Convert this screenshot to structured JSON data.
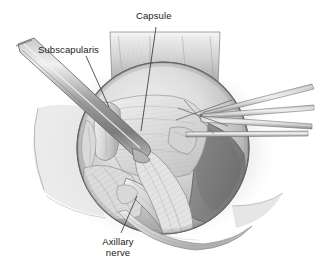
{
  "figure": {
    "kind": "surgical-illustration",
    "style": "grayscale-pencil-rendering",
    "background_color": "#ffffff",
    "width": 321,
    "height": 276
  },
  "labels": {
    "capsule": {
      "text": "Capsule",
      "color": "#1a1a1a",
      "leader": {
        "x1": 156,
        "y1": 27,
        "x2": 141,
        "y2": 131
      }
    },
    "subscapularis": {
      "text": "Subscapularis",
      "color": "#1a1a1a",
      "leader": {
        "x1": 86,
        "y1": 56,
        "x2": 109,
        "y2": 107
      }
    },
    "axillary_nerve": {
      "line1": "Axillary",
      "line2": "nerve",
      "color": "#1a1a1a",
      "leader": {
        "x1": 121,
        "y1": 233,
        "x2": 137,
        "y2": 196
      }
    }
  },
  "palette": {
    "background": "#ffffff",
    "outline": "#4a4a4a",
    "tissue_light": "#e7e7e7",
    "tissue_mid": "#c9c9c9",
    "tissue_dark": "#9a9a9a",
    "cavity_dark": "#8b8b8b",
    "cavity_deep": "#777777",
    "instrument_light": "#d8d8d8",
    "instrument_mid": "#a8a8a8",
    "instrument_dark": "#6e6e6e",
    "leader_line": "#3a3a3a",
    "halo": "#f0f0f0"
  },
  "anatomy": {
    "regions": [
      {
        "name": "wound-halo",
        "note": "soft gray halo surrounding circular exposure"
      },
      {
        "name": "retracted-flap-top",
        "note": "tissue flap retracted superiorly"
      },
      {
        "name": "joint-capsule",
        "note": "central striated capsule surface"
      },
      {
        "name": "subscapularis-tendon",
        "note": "tendon at left of exposure"
      },
      {
        "name": "glenohumeral-cavity",
        "note": "darker recess at right"
      },
      {
        "name": "axillary-nerve",
        "note": "cord-like structure at inferior border"
      },
      {
        "name": "inferior-tissue-fold",
        "note": "tissue fold at bottom of field"
      }
    ],
    "instruments": [
      {
        "name": "elevator-retractor",
        "entry": "upper-left",
        "note": "broad tapered blade"
      },
      {
        "name": "forceps-upper",
        "entry": "right",
        "note": "fine converging shaft"
      },
      {
        "name": "forceps-middle",
        "entry": "right",
        "note": "fine converging shaft"
      },
      {
        "name": "forceps-lower",
        "entry": "right",
        "note": "fine converging shaft"
      },
      {
        "name": "probe-horizontal",
        "entry": "right",
        "note": "straight horizontal shaft"
      }
    ]
  }
}
